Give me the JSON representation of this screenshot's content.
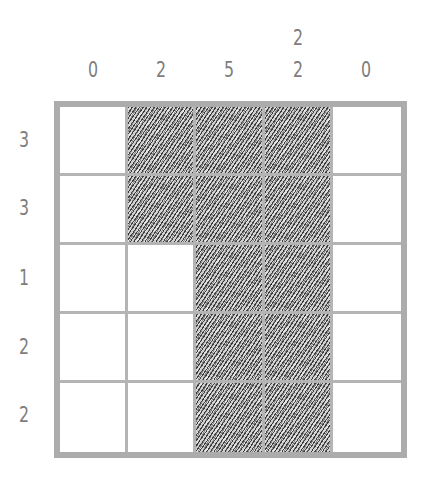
{
  "puzzle": {
    "type": "nonogram",
    "rows": 5,
    "cols": 5,
    "column_clues": [
      [
        "0"
      ],
      [
        "2"
      ],
      [
        "5"
      ],
      [
        "2",
        "2"
      ],
      [
        "0"
      ]
    ],
    "row_clues": [
      "3",
      "3",
      "1",
      "2",
      "2"
    ],
    "grid": [
      [
        0,
        1,
        1,
        1,
        0
      ],
      [
        0,
        1,
        1,
        1,
        0
      ],
      [
        0,
        0,
        1,
        1,
        0
      ],
      [
        0,
        0,
        1,
        1,
        0
      ],
      [
        0,
        0,
        1,
        1,
        0
      ]
    ]
  },
  "colors": {
    "clue_text": "#7d7d7d",
    "border": "#acacac",
    "grid_line": "#b4b4b4",
    "fill_shading": "#3a3a3a",
    "background": "#ffffff"
  }
}
